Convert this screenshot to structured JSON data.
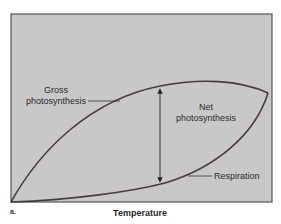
{
  "figure": {
    "panel_label": "a.",
    "x_axis_label": "Temperature",
    "background_color": "#c8c8c8",
    "frame_color": "#555555",
    "curve_color": "#4a3a3c",
    "arrow_color": "#222222"
  },
  "curves": {
    "gross": {
      "label_line1": "Gross",
      "label_line2": "photosynthesis"
    },
    "net": {
      "label_line1": "Net",
      "label_line2": "photosynthesis"
    },
    "respiration": {
      "label": "Respiration"
    }
  }
}
